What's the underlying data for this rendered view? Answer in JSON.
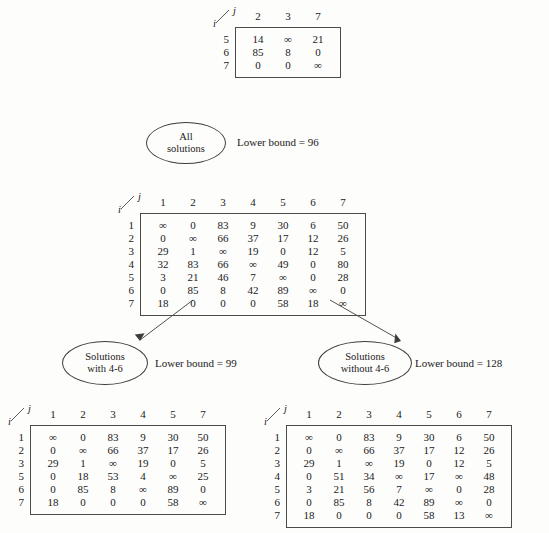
{
  "figure": {
    "corner_label_row": "i",
    "corner_label_col": "j",
    "infinity": "∞"
  },
  "top_matrix": {
    "name": "reduced-submatrix",
    "columns": [
      "2",
      "3",
      "7"
    ],
    "rows": [
      "5",
      "6",
      "7"
    ],
    "values": [
      [
        "14",
        "∞",
        "21"
      ],
      [
        "85",
        "8",
        "0"
      ],
      [
        "0",
        "0",
        "∞"
      ]
    ]
  },
  "tree": {
    "root": {
      "label_line1": "All",
      "label_line2": "solutions",
      "bound": "Lower bound = 96"
    },
    "left_child": {
      "label_line1": "Solutions",
      "label_line2": "with 4-6",
      "bound": "Lower bound = 99"
    },
    "right_child": {
      "label_line1": "Solutions",
      "label_line2": "without 4-6",
      "bound": "Lower bound = 128"
    }
  },
  "root_matrix": {
    "name": "root-cost-matrix",
    "columns": [
      "1",
      "2",
      "3",
      "4",
      "5",
      "6",
      "7"
    ],
    "rows": [
      "1",
      "2",
      "3",
      "4",
      "5",
      "6",
      "7"
    ],
    "values": [
      [
        "∞",
        "0",
        "83",
        "9",
        "30",
        "6",
        "50"
      ],
      [
        "0",
        "∞",
        "66",
        "37",
        "17",
        "12",
        "26"
      ],
      [
        "29",
        "1",
        "∞",
        "19",
        "0",
        "12",
        "5"
      ],
      [
        "32",
        "83",
        "66",
        "∞",
        "49",
        "0",
        "80"
      ],
      [
        "3",
        "21",
        "46",
        "7",
        "∞",
        "0",
        "28"
      ],
      [
        "0",
        "85",
        "8",
        "42",
        "89",
        "∞",
        "0"
      ],
      [
        "18",
        "0",
        "0",
        "0",
        "58",
        "18",
        "∞"
      ]
    ]
  },
  "left_matrix": {
    "name": "with-4-6-cost-matrix",
    "columns": [
      "1",
      "2",
      "3",
      "4",
      "5",
      "7"
    ],
    "rows": [
      "1",
      "2",
      "3",
      "5",
      "6",
      "7"
    ],
    "values": [
      [
        "∞",
        "0",
        "83",
        "9",
        "30",
        "50"
      ],
      [
        "0",
        "∞",
        "66",
        "37",
        "17",
        "26"
      ],
      [
        "29",
        "1",
        "∞",
        "19",
        "0",
        "5"
      ],
      [
        "0",
        "18",
        "53",
        "4",
        "∞",
        "25"
      ],
      [
        "0",
        "85",
        "8",
        "∞",
        "89",
        "0"
      ],
      [
        "18",
        "0",
        "0",
        "0",
        "58",
        "∞"
      ]
    ]
  },
  "right_matrix": {
    "name": "without-4-6-cost-matrix",
    "columns": [
      "1",
      "2",
      "3",
      "4",
      "5",
      "6",
      "7"
    ],
    "rows": [
      "1",
      "2",
      "3",
      "4",
      "5",
      "6",
      "7"
    ],
    "values": [
      [
        "∞",
        "0",
        "83",
        "9",
        "30",
        "6",
        "50"
      ],
      [
        "0",
        "∞",
        "66",
        "37",
        "17",
        "12",
        "26"
      ],
      [
        "29",
        "1",
        "∞",
        "19",
        "0",
        "12",
        "5"
      ],
      [
        "0",
        "51",
        "34",
        "∞",
        "17",
        "∞",
        "48"
      ],
      [
        "3",
        "21",
        "56",
        "7",
        "∞",
        "0",
        "28"
      ],
      [
        "0",
        "85",
        "8",
        "42",
        "89",
        "∞",
        "0"
      ],
      [
        "18",
        "0",
        "0",
        "0",
        "58",
        "13",
        "∞"
      ]
    ]
  },
  "colors": {
    "ink": "#1a1a1a",
    "rule": "#4a4a4a",
    "background": "#fdfdfc"
  }
}
